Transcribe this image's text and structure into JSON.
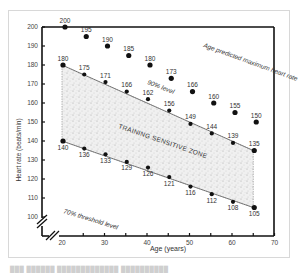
{
  "chart_data": {
    "type": "scatter",
    "title": "",
    "xlabel": "Age (years)",
    "ylabel": "Heart rate (beats/min)",
    "xlim": [
      20,
      70
    ],
    "ylim": [
      100,
      200
    ],
    "x_ticks": [
      20,
      30,
      40,
      50,
      60,
      70
    ],
    "y_ticks": [
      100,
      110,
      120,
      130,
      140,
      150,
      160,
      170,
      180,
      190,
      200
    ],
    "grid": false,
    "x": [
      20,
      25,
      30,
      35,
      40,
      45,
      50,
      55,
      60,
      65
    ],
    "series": [
      {
        "name": "Age predicted maximum heart rate",
        "values": [
          200,
          195,
          190,
          185,
          180,
          173,
          166,
          160,
          155,
          150
        ]
      },
      {
        "name": "90% level",
        "values": [
          180,
          175,
          171,
          166,
          162,
          156,
          149,
          144,
          139,
          135
        ]
      },
      {
        "name": "70% threshold level",
        "values": [
          140,
          136,
          133,
          129,
          126,
          121,
          116,
          112,
          108,
          105
        ]
      }
    ],
    "annotations": [
      {
        "text": "Age predicted maximum heart rate"
      },
      {
        "text": "90% level"
      },
      {
        "text": "TRAINING SENSITIVE ZONE"
      },
      {
        "text": "70% threshold level"
      }
    ]
  },
  "labels": {
    "x_axis": "Age (years)",
    "y_axis": "Heart rate (beats/min)",
    "max_line": "Age predicted maximum heart rate",
    "level_90": "90% level",
    "zone": "TRAINING SENSITIVE ZONE",
    "level_70": "70% threshold level"
  },
  "colors": {
    "ink": "#111111",
    "zone_fill": "#e6e6e6",
    "text": "#333333"
  }
}
